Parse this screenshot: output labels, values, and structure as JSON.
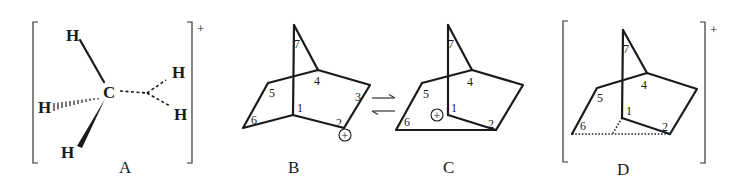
{
  "figure": {
    "structures": [
      {
        "id": "A",
        "label": "A",
        "description": "pentacoordinate carbonium ion CH5+",
        "central_atom": "C",
        "atoms": [
          "H",
          "H",
          "H",
          "H",
          "H"
        ],
        "charge": "+"
      },
      {
        "id": "B",
        "label": "B",
        "description": "2-norbornyl classical cation",
        "atom_numbers": [
          "1",
          "2",
          "3",
          "4",
          "5",
          "6",
          "7"
        ],
        "charge_symbol": "+"
      },
      {
        "id": "C",
        "label": "C",
        "description": "2-norbornyl classical cation (rearranged)",
        "atom_numbers": [
          "1",
          "2",
          "4",
          "5",
          "6",
          "7"
        ],
        "charge_symbol": "+"
      },
      {
        "id": "D",
        "label": "D",
        "description": "non-classical 2-norbornyl cation",
        "atom_numbers": [
          "1",
          "2",
          "4",
          "5",
          "6",
          "7"
        ],
        "charge": "+"
      }
    ],
    "equilibrium_arrows": {
      "forward": "→",
      "reverse": "←"
    }
  }
}
